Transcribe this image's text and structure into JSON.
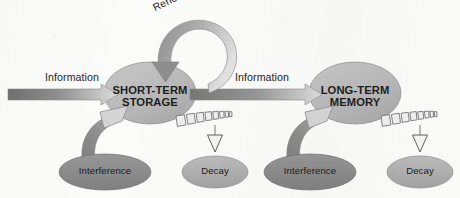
{
  "figure": {
    "background_color": "#fbfbfa"
  },
  "palette": {
    "store_fill": "#b9b9b9",
    "store_fill_light": "#c9c9c9",
    "interference_fill": "#8d8d8d",
    "decay_fill": "#b0b0b0",
    "arrow_dark": "#6f6f6f",
    "arrow_mid": "#9a9a9a",
    "arrow_light": "#d8d8d8",
    "outline": "#6b6b6b",
    "text": "#1f1f1f"
  },
  "nodes": {
    "short_term": {
      "label_line1": "SHORT-TERM",
      "label_line2": "STORAGE",
      "shape": "ellipse",
      "fill": "#b9b9b9"
    },
    "long_term": {
      "label_line1": "LONG-TERM",
      "label_line2": "MEMORY",
      "shape": "ellipse",
      "fill": "#b9b9b9"
    },
    "interference_left": {
      "label": "Interference",
      "shape": "ellipse",
      "fill": "#8d8d8d"
    },
    "interference_right": {
      "label": "Interference",
      "shape": "ellipse",
      "fill": "#8d8d8d"
    },
    "decay_left": {
      "label": "Decay",
      "shape": "ellipse",
      "fill": "#b0b0b0"
    },
    "decay_right": {
      "label": "Decay",
      "shape": "ellipse",
      "fill": "#b0b0b0"
    }
  },
  "edges": {
    "information_in": {
      "label": "Information",
      "style": "solid-gradient-arrow",
      "from": "input",
      "to": "short_term"
    },
    "information_transfer": {
      "label": "Information",
      "style": "solid-gradient-arrow",
      "from": "short_term",
      "to": "long_term"
    },
    "rehearsal_loop": {
      "label": "Rehearsal",
      "style": "curved-loop-arrow",
      "from": "short_term",
      "to": "short_term"
    },
    "interference_left_edge": {
      "label": "",
      "style": "curved-thick-arrow",
      "from": "interference_left",
      "to": "short_term"
    },
    "interference_right_edge": {
      "label": "",
      "style": "curved-thick-arrow",
      "from": "interference_right",
      "to": "long_term"
    },
    "decay_left_edge": {
      "label": "",
      "style": "tapering-dashed-arrow",
      "from": "short_term",
      "to": "decay_left"
    },
    "decay_right_edge": {
      "label": "",
      "style": "tapering-dashed-arrow",
      "from": "long_term",
      "to": "decay_right"
    }
  }
}
